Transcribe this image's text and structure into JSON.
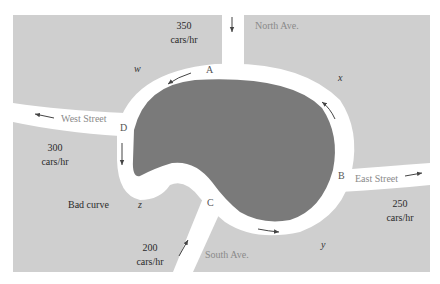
{
  "colors": {
    "background": "#ffffff",
    "land": "#cfcfcf",
    "road": "#ffffff",
    "lake": "#7a7a7a",
    "arrow": "#444444"
  },
  "streets": {
    "north": "North Ave.",
    "south": "South Ave.",
    "east": "East Street",
    "west": "West Street"
  },
  "intersections": {
    "a": "A",
    "b": "B",
    "c": "C",
    "d": "D"
  },
  "variables": {
    "w": "w",
    "x": "x",
    "y": "y",
    "z": "z"
  },
  "flows": {
    "north": {
      "value": "350",
      "unit": "cars/hr",
      "direction": "in"
    },
    "west": {
      "value": "300",
      "unit": "cars/hr",
      "direction": "out"
    },
    "east": {
      "value": "250",
      "unit": "cars/hr",
      "direction": "out"
    },
    "south": {
      "value": "200",
      "unit": "cars/hr",
      "direction": "in"
    }
  },
  "annotations": {
    "bad_curve": "Bad curve"
  }
}
